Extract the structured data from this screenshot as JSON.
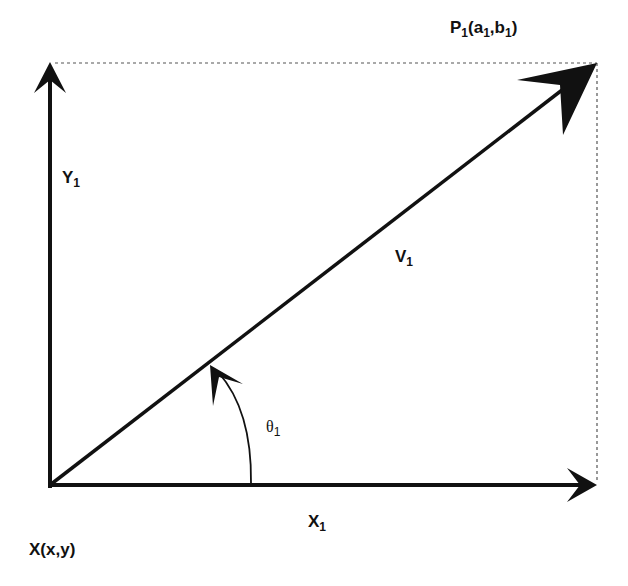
{
  "diagram": {
    "type": "vector-decomposition",
    "colors": {
      "stroke": "#111111",
      "background": "#ffffff",
      "guide": "#555555"
    },
    "labels": {
      "origin": "X(x,y)",
      "point": {
        "base": "P",
        "sub": "1",
        "args": [
          {
            "base": "a",
            "sub": "1"
          },
          {
            "base": "b",
            "sub": "1"
          }
        ]
      },
      "x_axis": {
        "base": "X",
        "sub": "1"
      },
      "y_axis": {
        "base": "Y",
        "sub": "1"
      },
      "vector": {
        "base": "V",
        "sub": "1"
      },
      "angle": {
        "base": "θ",
        "sub": "1"
      }
    },
    "geometry": {
      "origin": [
        50,
        485
      ],
      "x_axis_end": [
        597,
        485
      ],
      "y_axis_end": [
        50,
        62
      ],
      "vector_tip": [
        597,
        62
      ],
      "angle_arc_radius": 200
    }
  }
}
